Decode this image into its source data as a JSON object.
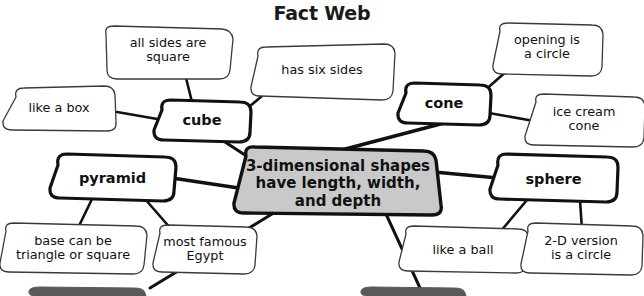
{
  "page": {
    "title": "Fact Web",
    "background_color": "#ffffff",
    "ink_color": "#111111",
    "center_fill": "#c9c9c9",
    "cutoff_fill": "#5a5a5a"
  },
  "center_node": {
    "id": "center-node",
    "text": "3-dimensional shapes\nhave length, width,\nand depth",
    "fill": "#c9c9c9"
  },
  "main_nodes": [
    {
      "id": "cube",
      "label": "cube"
    },
    {
      "id": "cone",
      "label": "cone"
    },
    {
      "id": "pyramid",
      "label": "pyramid"
    },
    {
      "id": "sphere",
      "label": "sphere"
    }
  ],
  "leaf_nodes": [
    {
      "id": "all-sides-are-square",
      "parent": "cube",
      "text": "all sides are\nsquare"
    },
    {
      "id": "like-a-box",
      "parent": "cube",
      "text": "like a box"
    },
    {
      "id": "has-six-sides",
      "parent": "cube",
      "text": "has six sides"
    },
    {
      "id": "opening-is-a-circle",
      "parent": "cone",
      "text": "opening is\na circle"
    },
    {
      "id": "ice-cream-cone",
      "parent": "cone",
      "text": "ice cream\ncone"
    },
    {
      "id": "base-can-be-triangle-or-square",
      "parent": "pyramid",
      "text": "base can be\ntriangle or square"
    },
    {
      "id": "most-famous-egypt",
      "parent": "pyramid",
      "text": "most famous\nEgypt"
    },
    {
      "id": "like-a-ball",
      "parent": "sphere",
      "text": "like a ball"
    },
    {
      "id": "2d-version-is-a-circle",
      "parent": "sphere",
      "text": "2-D version\nis a circle"
    }
  ],
  "cutoff_shapes": [
    {
      "id": "cutoff-shape-left"
    },
    {
      "id": "cutoff-shape-right"
    }
  ]
}
